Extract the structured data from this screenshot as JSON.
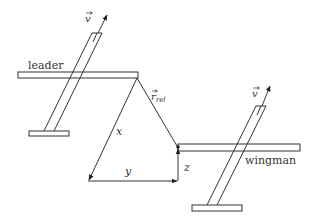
{
  "labels": {
    "leader": "leader",
    "wingman": "wingman",
    "v_leader": "v",
    "v_wingman": "v",
    "r_rel_main": "r",
    "r_rel_sub": "rel",
    "x": "x",
    "y": "y",
    "z": "z"
  },
  "colors": {
    "stroke": "#333333",
    "background": "#ffffff"
  }
}
